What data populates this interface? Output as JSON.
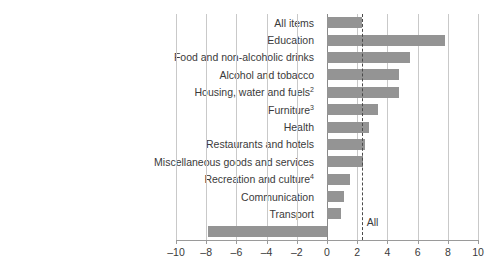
{
  "chart_data": {
    "type": "bar",
    "orientation": "horizontal",
    "title": "",
    "subtitle": "",
    "xlabel": "",
    "ylabel": "",
    "xlim": [
      -10,
      10
    ],
    "xticks": [
      -10,
      -8,
      -6,
      -4,
      -2,
      0,
      2,
      4,
      6,
      8,
      10
    ],
    "xtick_labels": [
      "–10",
      "–8",
      "–6",
      "–4",
      "–2",
      "0",
      "2",
      "4",
      "6",
      "8",
      "10"
    ],
    "grid": true,
    "legend": null,
    "bar_color": "#949494",
    "categories": [
      "All items",
      "Education",
      "Food and non-alcoholic drinks",
      "Alcohol and tobacco",
      "Housing, water and fuels",
      "Furniture",
      "Health",
      "Restaurants and hotels",
      "Miscellaneous goods and services",
      "Recreation and culture",
      "Communication",
      "Transport",
      "Clothing and footwear"
    ],
    "category_footnotes": [
      "",
      "",
      "",
      "",
      "2",
      "3",
      "",
      "",
      "",
      "4",
      "",
      "",
      ""
    ],
    "values": [
      2.3,
      7.8,
      5.5,
      4.8,
      4.8,
      3.4,
      2.8,
      2.5,
      2.4,
      1.5,
      1.1,
      0.9,
      -7.9
    ],
    "annotations": [
      {
        "name": "all-items-reference-line",
        "label": "All",
        "value": 2.3,
        "style": "dashed"
      }
    ]
  }
}
